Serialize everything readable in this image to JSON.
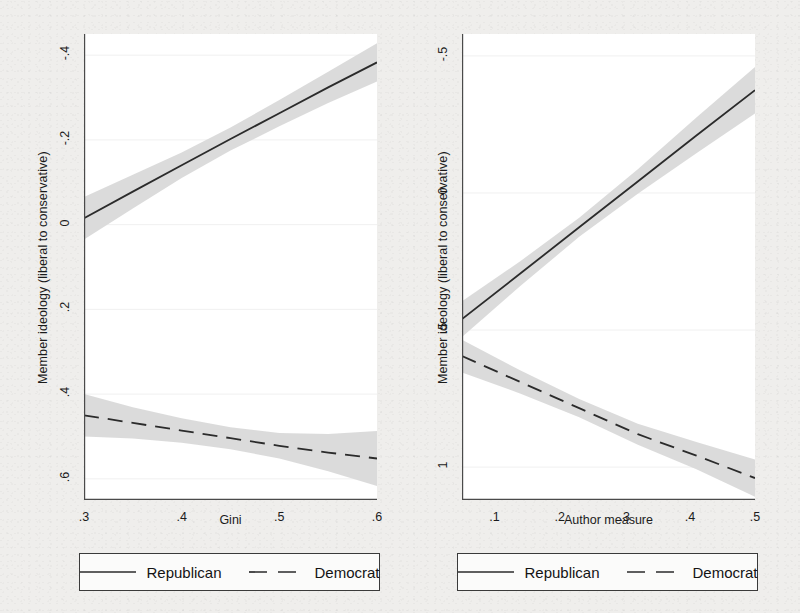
{
  "figure": {
    "background_color": "#efeeec",
    "plot_background_color": "#ffffff",
    "line_color": "#2b2b2b",
    "ci_band_color": "#d9d9d9",
    "axis_color": "#4a4a4a"
  },
  "panels": [
    {
      "id": "left",
      "y_axis_title": "Member ideology (liberal to conservative)",
      "x_axis_title": "Gini",
      "x_ticks": [
        ".3",
        ".4",
        ".5",
        ".6"
      ],
      "y_ticks": [
        ".6",
        ".4",
        ".2",
        "0",
        "-.2",
        "-.4"
      ],
      "legend": {
        "republican_label": "Republican",
        "democrat_label": "Democrat"
      }
    },
    {
      "id": "right",
      "y_axis_title": "Member ideology (liberal to conservative)",
      "x_axis_title": "Author measure",
      "x_ticks": [
        ".1",
        ".2",
        ".3",
        ".4",
        ".5"
      ],
      "y_ticks": [
        "1",
        ".5",
        "0",
        "-.5"
      ],
      "legend": {
        "republican_label": "Republican",
        "democrat_label": "Democrat"
      }
    }
  ],
  "chart_data": [
    {
      "type": "line",
      "panel": "left",
      "title": "",
      "xlabel": "Gini",
      "ylabel": "Member ideology (liberal to conservative)",
      "xlim": [
        0.3,
        0.6
      ],
      "ylim": [
        -0.45,
        0.65
      ],
      "xticks": [
        0.3,
        0.4,
        0.5,
        0.6
      ],
      "yticks": [
        -0.4,
        -0.2,
        0.0,
        0.2,
        0.4,
        0.6
      ],
      "grid": false,
      "legend_position": "below",
      "series": [
        {
          "name": "Republican",
          "style": "solid",
          "x": [
            0.3,
            0.35,
            0.4,
            0.45,
            0.5,
            0.55,
            0.6
          ],
          "values": [
            0.215,
            0.278,
            0.34,
            0.402,
            0.463,
            0.524,
            0.583
          ],
          "ci_lower": [
            0.165,
            0.238,
            0.31,
            0.375,
            0.432,
            0.487,
            0.538
          ],
          "ci_upper": [
            0.265,
            0.318,
            0.37,
            0.429,
            0.494,
            0.561,
            0.628
          ]
        },
        {
          "name": "Democrat",
          "style": "dashed",
          "x": [
            0.3,
            0.35,
            0.4,
            0.45,
            0.5,
            0.55,
            0.6
          ],
          "values": [
            -0.25,
            -0.268,
            -0.286,
            -0.304,
            -0.322,
            -0.338,
            -0.352
          ],
          "ci_lower": [
            -0.3,
            -0.305,
            -0.315,
            -0.33,
            -0.352,
            -0.382,
            -0.417
          ],
          "ci_upper": [
            -0.2,
            -0.231,
            -0.257,
            -0.278,
            -0.292,
            -0.294,
            -0.287
          ]
        }
      ]
    },
    {
      "type": "line",
      "panel": "right",
      "title": "",
      "xlabel": "Author measure",
      "ylabel": "Member ideology (liberal to conservative)",
      "xlim": [
        0.05,
        0.5
      ],
      "ylim": [
        -0.62,
        1.08
      ],
      "xticks": [
        0.1,
        0.2,
        0.3,
        0.4,
        0.5
      ],
      "yticks": [
        -0.5,
        0.0,
        0.5,
        1.0
      ],
      "grid": false,
      "legend_position": "below",
      "series": [
        {
          "name": "Republican",
          "style": "solid",
          "x": [
            0.05,
            0.14,
            0.23,
            0.32,
            0.41,
            0.5
          ],
          "values": [
            0.04,
            0.207,
            0.375,
            0.542,
            0.71,
            0.875
          ],
          "ci_lower": [
            -0.025,
            0.162,
            0.34,
            0.497,
            0.645,
            0.79
          ],
          "ci_upper": [
            0.105,
            0.252,
            0.41,
            0.587,
            0.775,
            0.96
          ]
        },
        {
          "name": "Democrat",
          "style": "dashed",
          "x": [
            0.05,
            0.14,
            0.23,
            0.32,
            0.41,
            0.5
          ],
          "values": [
            -0.095,
            -0.19,
            -0.285,
            -0.38,
            -0.458,
            -0.54
          ],
          "ci_lower": [
            -0.155,
            -0.232,
            -0.318,
            -0.418,
            -0.508,
            -0.608
          ],
          "ci_upper": [
            -0.035,
            -0.148,
            -0.252,
            -0.342,
            -0.408,
            -0.472
          ]
        }
      ]
    }
  ]
}
